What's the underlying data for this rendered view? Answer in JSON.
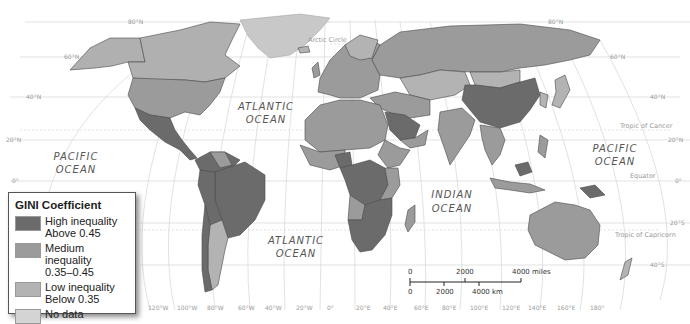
{
  "legend": {
    "title": "GINI Coefficient",
    "items": [
      {
        "line1": "High inequality",
        "line2": "Above 0.45",
        "color": "#6b6b6b"
      },
      {
        "line1": "Medium inequality",
        "line2": "0.35–0.45",
        "color": "#9b9b9b"
      },
      {
        "line1": "Low inequality",
        "line2": "Below 0.35",
        "color": "#b3b3b3"
      },
      {
        "line1": "No data",
        "line2": "",
        "color": "#d4d4d4"
      }
    ]
  },
  "oceans": {
    "pacific_west": [
      "PACIFIC",
      "OCEAN"
    ],
    "atlantic_north": [
      "ATLANTIC",
      "OCEAN"
    ],
    "atlantic_south": [
      "ATLANTIC",
      "OCEAN"
    ],
    "indian": [
      "INDIAN",
      "OCEAN"
    ],
    "pacific_east": [
      "PACIFIC",
      "OCEAN"
    ]
  },
  "reference_lines": {
    "arctic_circle": "Arctic Circle",
    "tropic_cancer": "Tropic of Cancer",
    "equator": "Equator",
    "tropic_capricorn": "Tropic of Capricorn"
  },
  "latitude_labels": {
    "left": [
      "80°N",
      "60°N",
      "40°N",
      "20°N",
      "0°"
    ],
    "right": [
      "80°N",
      "60°N",
      "40°N",
      "20°N",
      "0°",
      "20°S",
      "40°S"
    ]
  },
  "longitude_labels": [
    "120°W",
    "100°W",
    "80°W",
    "60°W",
    "40°W",
    "20°W",
    "0°",
    "20°E",
    "40°E",
    "60°E",
    "80°E",
    "100°E",
    "120°E",
    "140°E",
    "160°E",
    "180°"
  ],
  "scale_bar": {
    "miles": [
      "0",
      "2000",
      "4000 miles"
    ],
    "km": [
      "0",
      "2000",
      "4000 km"
    ]
  }
}
